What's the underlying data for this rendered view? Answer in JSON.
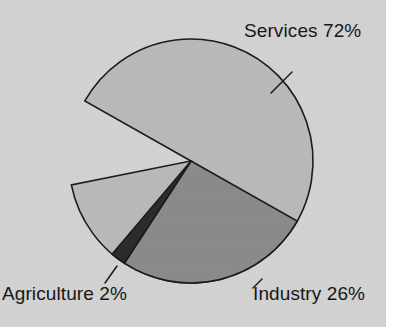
{
  "chart_data": {
    "type": "pie",
    "title": "",
    "subtitle": "",
    "xlabel": "",
    "ylabel": "",
    "legend_position": "none",
    "grid": false,
    "value_unit": "percent",
    "total": 100,
    "labels": [
      "Services",
      "Industry",
      "Agriculture"
    ],
    "values": [
      72,
      26,
      2
    ],
    "slices": [
      {
        "name": "Services",
        "value": 72,
        "value_text": "72%",
        "label_text": "Services 72%",
        "color": "#b9b9b9",
        "start_angle_deg": 209.5,
        "end_angle_deg": 528.7,
        "leader_line": true
      },
      {
        "name": "Industry",
        "value": 26,
        "value_text": "26%",
        "label_text": "Industry 26%",
        "color": "#8a8a8a",
        "start_angle_deg": 29.5,
        "end_angle_deg": 123.1,
        "leader_line": true
      },
      {
        "name": "Agriculture",
        "value": 2,
        "value_text": "2%",
        "label_text": "Agriculture 2%",
        "color": "#2b2b2b",
        "start_angle_deg": 123.1,
        "end_angle_deg": 130.3,
        "leader_line": true
      }
    ]
  },
  "figure": {
    "background_color": "#d2d2d2",
    "outline_color": "#1a1a1a",
    "center_x": 191,
    "center_y": 161,
    "radius": 122
  },
  "labels": {
    "services": "Services 72%",
    "industry": "Industry 26%",
    "agriculture": "Agriculture 2%"
  }
}
